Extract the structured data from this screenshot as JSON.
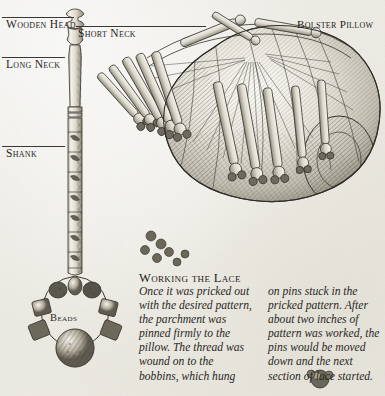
{
  "page": {
    "background_color": "#f2f1ec",
    "ink_color": "#2b2a27",
    "width": 385,
    "height": 396
  },
  "callouts": {
    "wooden_head": "Wooden Head",
    "short_neck": "Short Neck",
    "long_neck": "Long Neck",
    "shank": "Shank",
    "bolster_pillow": "Bolster Pillow",
    "beads": "Beads"
  },
  "article": {
    "heading": "Working the Lace",
    "column_left": "Once it was pricked out with the desired pattern, the parchment was pinned firmly to the pillow. The thread was wound on to the bobbins, which hung",
    "column_right": "on pins stuck in the pricked pattern. After about two inches of pattern was worked, the pins would be moved down and the next section of lace started."
  },
  "illustrations": {
    "bobbin": "lace-bobbin-engraving",
    "pillow": "bolster-pillow-with-bobbins-engraving",
    "spangle": "bead-spangle-engraving"
  }
}
